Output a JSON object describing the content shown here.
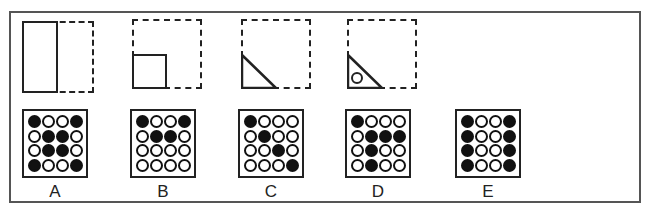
{
  "question": {
    "sequence_panels": [
      {
        "id": 1,
        "shape": "tall-rectangle",
        "description": "Solid rectangle on left half of dashed square"
      },
      {
        "id": 2,
        "shape": "small-square",
        "description": "Solid square in bottom-left quarter of dashed square"
      },
      {
        "id": 3,
        "shape": "right-triangle",
        "description": "Solid right triangle in bottom-left corner of dashed square"
      },
      {
        "id": 4,
        "shape": "right-triangle-with-circle",
        "description": "Solid right triangle with small circle inside, bottom-left of dashed square"
      }
    ],
    "options": [
      {
        "label": "A",
        "grid": [
          [
            1,
            0,
            0,
            1
          ],
          [
            0,
            1,
            1,
            0
          ],
          [
            0,
            1,
            1,
            0
          ],
          [
            1,
            0,
            0,
            1
          ]
        ]
      },
      {
        "label": "B",
        "grid": [
          [
            1,
            0,
            0,
            1
          ],
          [
            0,
            1,
            1,
            0
          ],
          [
            0,
            0,
            0,
            0
          ],
          [
            0,
            0,
            0,
            0
          ]
        ]
      },
      {
        "label": "C",
        "grid": [
          [
            1,
            0,
            0,
            0
          ],
          [
            0,
            1,
            0,
            0
          ],
          [
            0,
            0,
            1,
            0
          ],
          [
            0,
            0,
            0,
            1
          ]
        ]
      },
      {
        "label": "D",
        "grid": [
          [
            1,
            0,
            0,
            0
          ],
          [
            0,
            1,
            1,
            1
          ],
          [
            0,
            1,
            0,
            0
          ],
          [
            0,
            1,
            0,
            0
          ]
        ]
      },
      {
        "label": "E",
        "grid": [
          [
            1,
            0,
            0,
            1
          ],
          [
            1,
            0,
            0,
            1
          ],
          [
            1,
            0,
            0,
            1
          ],
          [
            1,
            0,
            0,
            1
          ]
        ]
      }
    ]
  }
}
